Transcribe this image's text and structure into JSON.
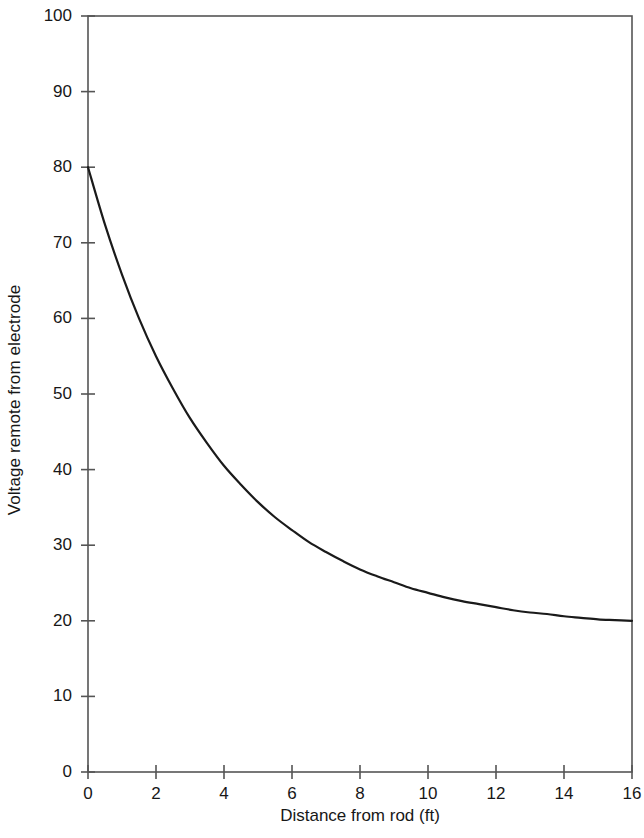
{
  "chart_data": {
    "type": "line",
    "title": "",
    "xlabel": "Distance from rod (ft)",
    "ylabel": "Voltage remote from electrode",
    "xlim": [
      0,
      16
    ],
    "ylim": [
      0,
      100
    ],
    "xticks": [
      0,
      2,
      4,
      6,
      8,
      10,
      12,
      14,
      16
    ],
    "xtick_labels": [
      "0",
      "2",
      "4",
      "6",
      "8",
      "10",
      "12",
      "14",
      "16"
    ],
    "yticks": [
      0,
      10,
      20,
      30,
      40,
      50,
      60,
      70,
      80,
      90,
      100
    ],
    "ytick_labels": [
      "0",
      "10",
      "20",
      "30",
      "40",
      "50",
      "60",
      "70",
      "80",
      "90",
      "100"
    ],
    "grid": false,
    "legend": false,
    "frame": "full-box",
    "line_color": "#1a1a1a",
    "line_width": 2.2,
    "series": [
      {
        "name": "Voltage remote from electrode",
        "x": [
          0,
          0.5,
          1,
          1.5,
          2,
          2.5,
          3,
          3.5,
          4,
          4.5,
          5,
          5.5,
          6,
          6.5,
          7,
          7.5,
          8,
          8.5,
          9,
          9.5,
          10,
          10.5,
          11,
          11.5,
          12,
          12.5,
          13,
          13.5,
          14,
          14.5,
          15,
          15.5,
          16
        ],
        "values": [
          80.0,
          72.4,
          65.8,
          60.0,
          55.0,
          50.7,
          46.8,
          43.5,
          40.5,
          38.0,
          35.7,
          33.7,
          32.0,
          30.4,
          29.1,
          27.9,
          26.8,
          25.9,
          25.1,
          24.3,
          23.7,
          23.1,
          22.6,
          22.2,
          21.8,
          21.4,
          21.1,
          20.9,
          20.6,
          20.4,
          20.2,
          20.1,
          20.0
        ]
      }
    ],
    "annotations": []
  },
  "axes": {
    "y_axis_label": "Voltage remote from electrode",
    "x_axis_label": "Distance from rod (ft)"
  }
}
